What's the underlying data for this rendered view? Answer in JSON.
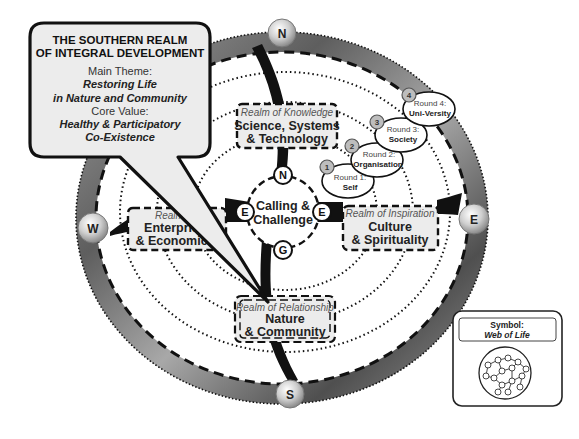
{
  "callout": {
    "title_line1": "THE SOUTHERN REALM",
    "title_line2": "OF INTEGRAL DEVELOPMENT",
    "theme_label": "Main Theme:",
    "theme_line1": "Restoring Life",
    "theme_line2": "in Nature and Community",
    "value_label": "Core Value:",
    "value_line1": "Healthy & Participatory",
    "value_line2": "Co-Existence"
  },
  "compass": {
    "north": "N",
    "south": "S",
    "east": "E",
    "west": "W"
  },
  "center": {
    "line1": "Calling &",
    "line2": "Challenge",
    "nodes": {
      "top": "N",
      "left": "E",
      "right": "E",
      "bottom": "G"
    }
  },
  "realms": {
    "knowledge": {
      "subtitle": "Realm of Knowledge",
      "line1": "Science, Systems",
      "line2": "& Technology"
    },
    "inspiration": {
      "subtitle": "Realm of Inspiration",
      "line1": "Culture",
      "line2": "& Spirituality"
    },
    "enterprise": {
      "subtitle": "Realm of",
      "line1": "Enterprise",
      "line2": "& Economics"
    },
    "relationship": {
      "subtitle": "Realm of Relationship",
      "line1": "Nature",
      "line2": "& Community"
    }
  },
  "rounds": [
    {
      "number": "1",
      "label": "Round 1:",
      "name": "Self"
    },
    {
      "number": "2",
      "label": "Round 2:",
      "name": "Organisation"
    },
    {
      "number": "3",
      "label": "Round 3:",
      "name": "Society"
    },
    {
      "number": "4",
      "label": "Round 4:",
      "name": "Uni-Versity"
    }
  ],
  "symbol": {
    "label": "Symbol:",
    "name": "Web of Life"
  },
  "colors": {
    "ring": "#6e6e6e",
    "box_fill": "#ececec",
    "round_badge": "#bdbdbd",
    "ink": "#111111"
  }
}
